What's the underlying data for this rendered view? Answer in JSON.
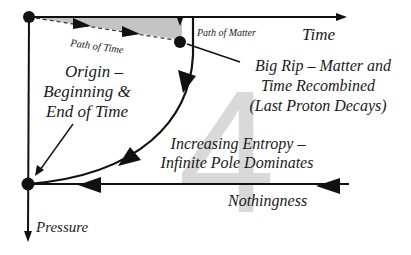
{
  "diagram": {
    "watermark": "4",
    "axes": {
      "time_label": "Time",
      "pressure_label": "Pressure"
    },
    "labels": {
      "path_of_time": "Path of Time",
      "path_of_matter": "Path of Matter",
      "origin": [
        "Origin –",
        "Beginning &",
        "End of Time"
      ],
      "big_rip": [
        "Big Rip – Matter and",
        "Time Recombined",
        "(Last Proton Decays)"
      ],
      "entropy": [
        "Increasing Entropy –",
        "Infinite Pole Dominates"
      ],
      "nothingness": "Nothingness"
    },
    "colors": {
      "ink": "#111111",
      "shade": "#c4c4c4",
      "watermark": "#d9d9d9"
    }
  }
}
